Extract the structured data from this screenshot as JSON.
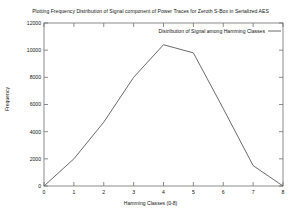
{
  "chart_data": {
    "type": "line",
    "title": "Plotting Frequency Distribution of Signal component of Power Traces for Zeroth S-Box in Serialized AES",
    "xlabel": "Hamming Classes (0-8)",
    "ylabel": "Frequency",
    "x": [
      0,
      1,
      2,
      3,
      4,
      5,
      6,
      7,
      8
    ],
    "series": [
      {
        "name": "Distribution of Signal among Hamming Classes",
        "values": [
          0,
          2000,
          4700,
          8000,
          10400,
          9800,
          5700,
          1500,
          0
        ]
      }
    ],
    "xlim": [
      0,
      8
    ],
    "ylim": [
      0,
      12000
    ],
    "xticks": [
      "0",
      "1",
      "2",
      "3",
      "4",
      "5",
      "6",
      "7",
      "8"
    ],
    "yticks": [
      "0",
      "2000",
      "4000",
      "6000",
      "8000",
      "10000",
      "12000"
    ],
    "grid": false,
    "legend_position": "top-right-inside",
    "line_color": "#5a5a5a"
  }
}
